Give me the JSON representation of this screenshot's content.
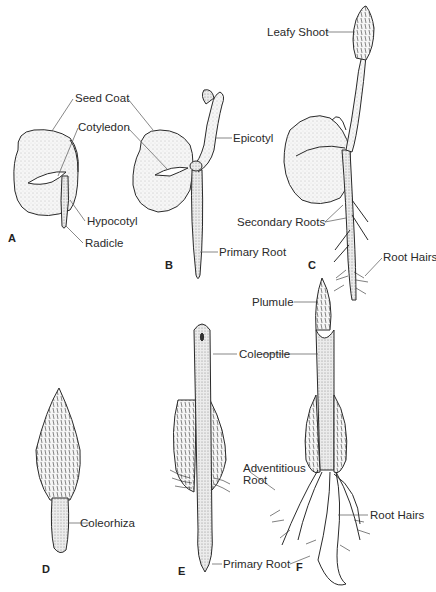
{
  "figure": {
    "panels": [
      {
        "id": "A",
        "label": "A",
        "x": 8,
        "y": 232
      },
      {
        "id": "B",
        "label": "B",
        "x": 165,
        "y": 259
      },
      {
        "id": "C",
        "label": "C",
        "x": 308,
        "y": 259
      },
      {
        "id": "D",
        "label": "D",
        "x": 42,
        "y": 563
      },
      {
        "id": "E",
        "label": "E",
        "x": 178,
        "y": 565
      },
      {
        "id": "F",
        "label": "F",
        "x": 296,
        "y": 561
      }
    ],
    "labels": {
      "seed_coat": "Seed Coat",
      "cotyledon": "Cotyledon",
      "hypocotyl": "Hypocotyl",
      "radicle": "Radicle",
      "epicotyl": "Epicotyl",
      "primary_root_b": "Primary Root",
      "leafy_shoot": "Leafy Shoot",
      "secondary_roots": "Secondary Roots",
      "root_hairs_c": "Root Hairs",
      "coleorhiza": "Coleorhiza",
      "plumule": "Plumule",
      "coleoptile": "Coleoptile",
      "adventitious_root_1": "Adventitious",
      "adventitious_root_2": "Root",
      "root_hairs_f": "Root Hairs",
      "primary_root_ef": "Primary Root"
    },
    "colors": {
      "ink": "#2a2a2a",
      "fill": "#f4f4f4",
      "background": "#ffffff"
    }
  }
}
